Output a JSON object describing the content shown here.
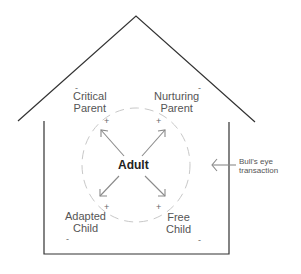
{
  "diagram": {
    "center": {
      "label": "Adult"
    },
    "states": [
      {
        "id": "critical-parent",
        "line1": "Critical",
        "line2": "Parent",
        "minus": "-",
        "plus": "+"
      },
      {
        "id": "nurturing-parent",
        "line1": "Nurturing",
        "line2": "Parent",
        "minus": "-",
        "plus": "+"
      },
      {
        "id": "adapted-child",
        "line1": "Adapted",
        "line2": "Child",
        "minus": "-",
        "plus": "+"
      },
      {
        "id": "free-child",
        "line1": "Free",
        "line2": "Child",
        "minus": "-",
        "plus": "+"
      }
    ],
    "annotation": {
      "line1": "Bull's eye",
      "line2": "transaction"
    },
    "colors": {
      "house": "#333333",
      "arrows": "#8a8a8a",
      "circle": "#c8c8c8",
      "text": "#555555"
    }
  }
}
